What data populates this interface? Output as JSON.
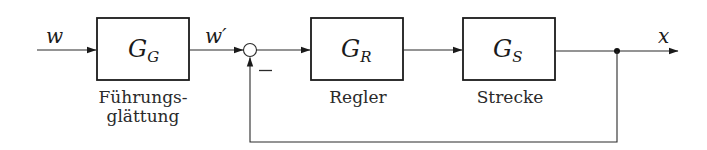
{
  "diagram": {
    "type": "control-loop-block-diagram",
    "signals": {
      "input": "w",
      "filtered_reference": "w′",
      "output": "x"
    },
    "summing_junction": {
      "feedback_sign": "−"
    },
    "blocks": [
      {
        "id": "GG",
        "symbol_main": "G",
        "symbol_sub": "G",
        "caption_line1": "Führungs-",
        "caption_line2": "glättung"
      },
      {
        "id": "GR",
        "symbol_main": "G",
        "symbol_sub": "R",
        "caption_line1": "Regler",
        "caption_line2": ""
      },
      {
        "id": "GS",
        "symbol_main": "G",
        "symbol_sub": "S",
        "caption_line1": "Strecke",
        "caption_line2": ""
      }
    ],
    "colors": {
      "stroke": "#1a1a1a",
      "background": "#ffffff"
    }
  }
}
